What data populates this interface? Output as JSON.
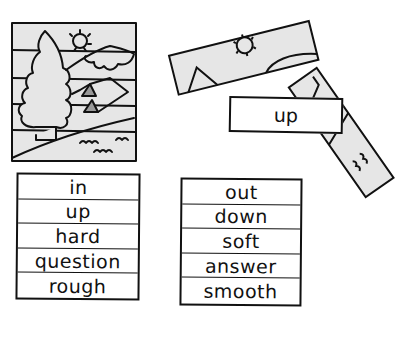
{
  "puzzle": {
    "colors": {
      "fill": "#e6e6e6",
      "ink": "#111111",
      "background": "#ffffff"
    },
    "scene_strips_count": 5,
    "loose_strip_label": "up"
  },
  "left_list": {
    "words": [
      "in",
      "up",
      "hard",
      "question",
      "rough"
    ]
  },
  "right_list": {
    "words": [
      "out",
      "down",
      "soft",
      "answer",
      "smooth"
    ]
  }
}
